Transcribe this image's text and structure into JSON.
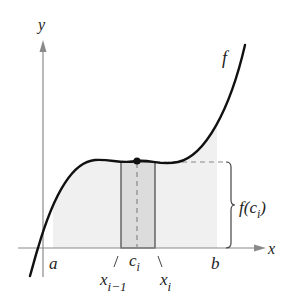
{
  "diagram": {
    "type": "riemann-sum-rectangle",
    "axes": {
      "x_label": "x",
      "y_label": "y"
    },
    "function_label": "f",
    "interval": {
      "left_label": "a",
      "right_label": "b"
    },
    "subinterval": {
      "left_label_base": "x",
      "left_label_sub": "i−1",
      "right_label_base": "x",
      "right_label_sub": "i",
      "sample_label_base": "c",
      "sample_label_sub": "i"
    },
    "height_label": {
      "prefix": "f(c",
      "sub": "i",
      "suffix": ")"
    },
    "colors": {
      "curve": "#111111",
      "axis": "#8a8a8a",
      "region_fill": "#f0f0f0",
      "rectangle_fill": "#dcdcdc",
      "rectangle_stroke": "#444444",
      "dashed": "#888888",
      "point": "#111111"
    }
  }
}
